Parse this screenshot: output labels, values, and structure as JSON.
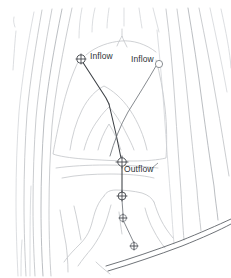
{
  "figure": {
    "name": "contour-flow-map",
    "background_color": "#ffffff",
    "width": 231,
    "height": 278
  },
  "colors": {
    "contour": "#b9bcc0",
    "contour_faint": "#cdd0d4",
    "contour_mid": "#a9adb2",
    "flow_path": "#3b3f44",
    "boundary": "#555a60",
    "label_text": "#2e3236",
    "node_fill": "#ffffff"
  },
  "labels": {
    "inflow_left": "Inflow",
    "inflow_right": "Inflow",
    "outflow": "Outflow"
  },
  "nodes": [
    {
      "id": "inflow-left",
      "label": "Inflow",
      "x": 81,
      "y": 59,
      "marker": "circle-crosshair"
    },
    {
      "id": "inflow-right",
      "label": "Inflow",
      "x": 159,
      "y": 64,
      "marker": "circle-plain"
    },
    {
      "id": "outflow",
      "label": "Outflow",
      "x": 122,
      "y": 162,
      "marker": "circle-crosshair"
    },
    {
      "id": "junction-1",
      "label": "",
      "x": 122,
      "y": 196,
      "marker": "circle-crosshair"
    },
    {
      "id": "junction-2",
      "label": "",
      "x": 123,
      "y": 218,
      "marker": "circle-crosshair"
    },
    {
      "id": "junction-3",
      "label": "",
      "x": 134,
      "y": 246,
      "marker": "circle-crosshair"
    }
  ],
  "label_positions": {
    "inflow_left": {
      "x": 90,
      "y": 52
    },
    "inflow_right": {
      "x": 131,
      "y": 55
    },
    "outflow": {
      "x": 124,
      "y": 165
    }
  }
}
